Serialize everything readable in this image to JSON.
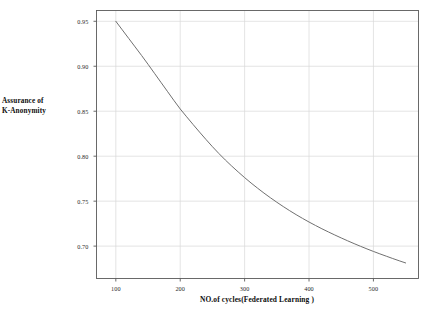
{
  "chart_data": {
    "type": "line",
    "title": "",
    "xlabel": "NO.of cycles(Federated Learning )",
    "ylabel": "Assurance of K-Anonymity",
    "ylabel_lines": [
      "Assurance of",
      "K-Anonymity"
    ],
    "xlim": [
      70,
      570
    ],
    "ylim": [
      0.664,
      0.962
    ],
    "xticks": [
      100,
      200,
      300,
      400,
      500
    ],
    "xtick_labels": [
      "100",
      "200",
      "300",
      "400",
      "500"
    ],
    "yticks": [
      0.7,
      0.75,
      0.8,
      0.85,
      0.9,
      0.95
    ],
    "ytick_labels": [
      "0.70",
      "0.75",
      "0.80",
      "0.85",
      "0.90",
      "0.95"
    ],
    "grid": true,
    "grid_color": "#d9d9d9",
    "legend": "none",
    "series": [
      {
        "name": "Assurance of K-Anonymity",
        "color": "#707070",
        "line_width": 1.0,
        "x": [
          100,
          110,
          120,
          130,
          140,
          150,
          160,
          170,
          180,
          190,
          200,
          210,
          220,
          230,
          240,
          250,
          260,
          270,
          280,
          290,
          300,
          310,
          320,
          330,
          340,
          350,
          360,
          370,
          380,
          390,
          400,
          410,
          420,
          430,
          440,
          450,
          460,
          470,
          480,
          490,
          500,
          510,
          520,
          530,
          540,
          550
        ],
        "y": [
          0.95,
          0.9405,
          0.931,
          0.9215,
          0.912,
          0.9022,
          0.8922,
          0.8822,
          0.8722,
          0.8622,
          0.8525,
          0.8438,
          0.8352,
          0.8268,
          0.8186,
          0.8106,
          0.803,
          0.7958,
          0.789,
          0.7825,
          0.7762,
          0.7702,
          0.7645,
          0.759,
          0.7538,
          0.7488,
          0.744,
          0.7394,
          0.735,
          0.7308,
          0.7268,
          0.723,
          0.7193,
          0.7158,
          0.7124,
          0.7091,
          0.7059,
          0.7028,
          0.6998,
          0.6969,
          0.6941,
          0.6914,
          0.6888,
          0.6862,
          0.6837,
          0.6813
        ]
      }
    ],
    "axis_frame_color": "#5a5a5a",
    "background": "#ffffff"
  },
  "figure": {
    "width": 438,
    "height": 316
  }
}
